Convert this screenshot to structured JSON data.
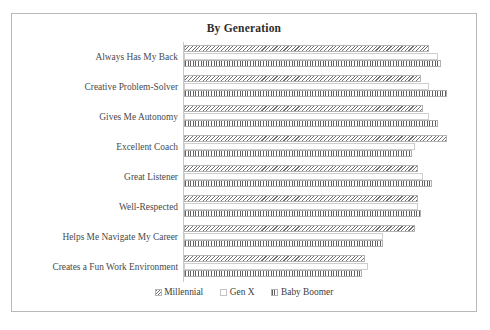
{
  "figure": {
    "title": "By Generation",
    "border_color": "#b9b9b9",
    "background": "#ffffff"
  },
  "legend": {
    "position": "bottom-center",
    "entries": [
      {
        "label": "Millennial",
        "pattern": "diagonal-hatch",
        "swatch_class": "swatch-millennial"
      },
      {
        "label": "Gen X",
        "pattern": "empty",
        "swatch_class": "swatch-genx"
      },
      {
        "label": "Baby Boomer",
        "pattern": "vertical-stripes",
        "swatch_class": "swatch-boomer"
      }
    ]
  },
  "chart_data": {
    "type": "bar",
    "orientation": "horizontal",
    "title": "By Generation",
    "xlabel": "",
    "ylabel": "",
    "grid": false,
    "legend_position": "bottom-center",
    "xlim": [
      0,
      100
    ],
    "categories": [
      "Always Has My Back",
      "Creative Problem-Solver",
      "Gives Me Autonomy",
      "Excellent Coach",
      "Great Listener",
      "Well-Respected",
      "Helps Me Navigate My Career",
      "Creates a Fun Work Environment"
    ],
    "series": [
      {
        "name": "Millennial",
        "values": [
          84,
          81,
          82,
          90,
          80,
          80,
          79,
          62
        ]
      },
      {
        "name": "Gen X",
        "values": [
          87,
          84,
          84,
          79,
          82,
          80,
          68,
          63
        ]
      },
      {
        "name": "Baby Boomer",
        "values": [
          88,
          90,
          87,
          78,
          85,
          81,
          68,
          61
        ]
      }
    ]
  }
}
